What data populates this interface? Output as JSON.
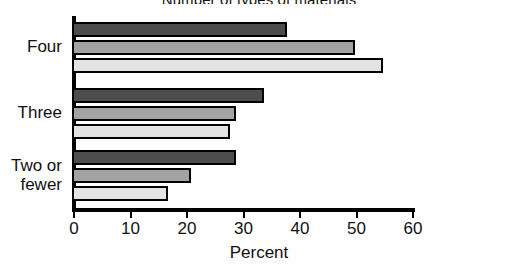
{
  "chart_data": {
    "type": "bar",
    "orientation": "horizontal",
    "title": "Number of types of materials",
    "xlabel": "Percent",
    "ylabel": "",
    "xlim": [
      0,
      60
    ],
    "xticks": [
      0,
      10,
      20,
      30,
      40,
      50,
      60
    ],
    "xtick_labels": [
      "0",
      "10",
      "20",
      "30",
      "40",
      "50",
      "60"
    ],
    "grid": false,
    "legend": "none",
    "categories": [
      "Four",
      "Three",
      "Two or fewer"
    ],
    "series": [
      {
        "name": "series-1",
        "color": "#4d4d4d",
        "values": [
          38,
          34,
          29
        ]
      },
      {
        "name": "series-2",
        "color": "#a3a3a3",
        "values": [
          50,
          29,
          21
        ]
      },
      {
        "name": "series-3",
        "color": "#e3e3e3",
        "values": [
          55,
          28,
          17
        ]
      }
    ],
    "bars": [
      {
        "category": "Four",
        "series": "series-1",
        "value": 38
      },
      {
        "category": "Four",
        "series": "series-2",
        "value": 50
      },
      {
        "category": "Four",
        "series": "series-3",
        "value": 55
      },
      {
        "category": "Three",
        "series": "series-1",
        "value": 34
      },
      {
        "category": "Three",
        "series": "series-2",
        "value": 29
      },
      {
        "category": "Three",
        "series": "series-3",
        "value": 28
      },
      {
        "category": "Two or fewer",
        "series": "series-1",
        "value": 29
      },
      {
        "category": "Two or fewer",
        "series": "series-2",
        "value": 21
      },
      {
        "category": "Two or fewer",
        "series": "series-3",
        "value": 17
      }
    ]
  },
  "labels": {
    "cat0": "Four",
    "cat1": "Three",
    "cat2": "Two or\nfewer"
  }
}
